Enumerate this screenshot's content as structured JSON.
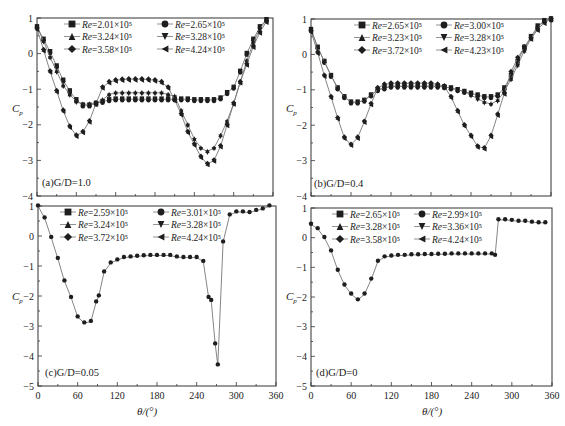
{
  "figure": {
    "y_axis_label": "C_p",
    "x_axis_label": "θ/(°)"
  },
  "chart_data": [
    {
      "type": "scatter",
      "panel_label": "(a)G/D=1.0",
      "gap_ratio": "1.0",
      "xlabel": "",
      "ylabel": "Cp",
      "xlim": [
        0,
        360
      ],
      "ylim": [
        -4,
        1
      ],
      "xticks": [
        0,
        60,
        120,
        180,
        240,
        300,
        360
      ],
      "yticks": [
        1,
        0,
        -1,
        -2,
        -3,
        -4
      ],
      "ytick_labels": [
        "1",
        "0",
        "−1",
        "−2",
        "−3",
        "−4"
      ],
      "show_xtick_labels": false,
      "legend_position": "top-center",
      "legend": [
        "Re=2.01×10⁵",
        "Re=2.65×10⁵",
        "Re=3.24×10⁵",
        "Re=3.28×10⁵",
        "Re=3.58×10⁵",
        "Re=4.24×10⁵"
      ],
      "markers": [
        "square",
        "circle",
        "triangle-up",
        "triangle-down",
        "diamond",
        "triangle-left"
      ],
      "series": [
        {
          "name": "low Re group (Re=2.01–2.65×10⁵)",
          "x": [
            0,
            10,
            20,
            30,
            40,
            50,
            60,
            70,
            80,
            90,
            100,
            110,
            120,
            130,
            140,
            150,
            160,
            170,
            180,
            190,
            200,
            210,
            220,
            230,
            240,
            250,
            260,
            270,
            280,
            290,
            300,
            310,
            320,
            330,
            340,
            350
          ],
          "values": [
            0.75,
            0.4,
            0.05,
            -0.35,
            -0.75,
            -1.05,
            -1.3,
            -1.45,
            -1.45,
            -1.4,
            -1.35,
            -1.3,
            -1.28,
            -1.28,
            -1.28,
            -1.28,
            -1.28,
            -1.28,
            -1.28,
            -1.28,
            -1.28,
            -1.28,
            -1.28,
            -1.28,
            -1.3,
            -1.3,
            -1.3,
            -1.3,
            -1.25,
            -1.1,
            -0.95,
            -0.5,
            0.0,
            0.4,
            0.75,
            0.95
          ]
        },
        {
          "name": "mid Re group (Re=3.24–3.28×10⁵)",
          "x": [
            0,
            10,
            20,
            30,
            40,
            50,
            60,
            70,
            80,
            90,
            100,
            110,
            120,
            130,
            140,
            150,
            160,
            170,
            180,
            190,
            200,
            210,
            220,
            230,
            240,
            250,
            260,
            270,
            280,
            290,
            300,
            310,
            320,
            330,
            340,
            350
          ],
          "values": [
            0.75,
            0.35,
            -0.1,
            -0.5,
            -0.9,
            -1.15,
            -1.35,
            -1.42,
            -1.42,
            -1.38,
            -1.3,
            -1.15,
            -1.1,
            -1.1,
            -1.1,
            -1.1,
            -1.1,
            -1.1,
            -1.1,
            -1.1,
            -1.15,
            -1.2,
            -1.6,
            -2.0,
            -2.4,
            -2.65,
            -2.75,
            -2.65,
            -2.3,
            -1.9,
            -1.4,
            -0.8,
            -0.2,
            0.3,
            0.7,
            0.95
          ]
        },
        {
          "name": "high Re group (Re=3.58–4.24×10⁵)",
          "x": [
            0,
            10,
            20,
            30,
            40,
            50,
            60,
            70,
            80,
            90,
            100,
            110,
            120,
            130,
            140,
            150,
            160,
            170,
            180,
            190,
            200,
            210,
            220,
            230,
            240,
            250,
            260,
            270,
            280,
            290,
            300,
            310,
            320,
            330,
            340,
            350
          ],
          "values": [
            0.7,
            0.1,
            -0.5,
            -1.05,
            -1.6,
            -2.05,
            -2.3,
            -2.2,
            -1.9,
            -1.4,
            -0.95,
            -0.8,
            -0.75,
            -0.73,
            -0.72,
            -0.72,
            -0.72,
            -0.73,
            -0.75,
            -0.8,
            -0.95,
            -1.3,
            -1.7,
            -2.2,
            -2.55,
            -2.9,
            -3.1,
            -3.0,
            -2.6,
            -2.0,
            -1.4,
            -0.8,
            -0.3,
            0.2,
            0.6,
            0.9
          ]
        }
      ]
    },
    {
      "type": "scatter",
      "panel_label": "(b)G/D=0.4",
      "gap_ratio": "0.4",
      "xlabel": "",
      "ylabel": "Cp",
      "xlim": [
        0,
        360
      ],
      "ylim": [
        -4,
        1
      ],
      "xticks": [
        0,
        60,
        120,
        180,
        240,
        300,
        360
      ],
      "yticks": [
        1,
        0,
        -1,
        -2,
        -3,
        -4
      ],
      "ytick_labels": [
        "1",
        "0",
        "−1",
        "−2",
        "−3",
        "−4"
      ],
      "show_xtick_labels": false,
      "legend_position": "top-center",
      "legend": [
        "Re=2.65×10⁵",
        "Re=3.00×10⁵",
        "Re=3.23×10⁵",
        "Re=3.28×10⁵",
        "Re=3.72×10⁵",
        "Re=4.23×10⁵"
      ],
      "markers": [
        "square",
        "circle",
        "triangle-up",
        "triangle-down",
        "diamond",
        "triangle-left"
      ],
      "series": [
        {
          "name": "low Re group (Re=2.65–3.00×10⁵)",
          "x": [
            0,
            10,
            20,
            30,
            40,
            50,
            60,
            70,
            80,
            90,
            100,
            110,
            120,
            130,
            140,
            150,
            160,
            170,
            180,
            190,
            200,
            210,
            220,
            230,
            240,
            250,
            260,
            270,
            280,
            290,
            300,
            310,
            320,
            330,
            340,
            350,
            360
          ],
          "values": [
            0.7,
            0.2,
            -0.2,
            -0.6,
            -0.95,
            -1.2,
            -1.35,
            -1.35,
            -1.3,
            -1.15,
            -1.0,
            -0.95,
            -0.9,
            -0.9,
            -0.9,
            -0.9,
            -0.9,
            -0.9,
            -0.9,
            -0.9,
            -0.92,
            -0.95,
            -1.0,
            -1.05,
            -1.1,
            -1.15,
            -1.2,
            -1.2,
            -1.15,
            -0.95,
            -0.6,
            -0.2,
            0.2,
            0.5,
            0.8,
            0.95,
            1.0
          ]
        },
        {
          "name": "mid Re group (Re=3.23–3.28×10⁵)",
          "x": [
            0,
            10,
            20,
            30,
            40,
            50,
            60,
            70,
            80,
            90,
            100,
            110,
            120,
            130,
            140,
            150,
            160,
            170,
            180,
            190,
            200,
            210,
            220,
            230,
            240,
            250,
            260,
            270,
            280,
            290,
            300,
            310,
            320,
            330,
            340,
            350,
            360
          ],
          "values": [
            0.7,
            0.2,
            -0.2,
            -0.6,
            -0.95,
            -1.2,
            -1.35,
            -1.35,
            -1.3,
            -1.15,
            -1.0,
            -0.95,
            -0.9,
            -0.9,
            -0.9,
            -0.9,
            -0.9,
            -0.9,
            -0.9,
            -0.9,
            -0.92,
            -0.95,
            -1.0,
            -1.05,
            -1.15,
            -1.25,
            -1.35,
            -1.4,
            -1.3,
            -1.05,
            -0.7,
            -0.3,
            0.1,
            0.45,
            0.75,
            0.95,
            1.0
          ]
        },
        {
          "name": "high Re group (Re=3.72–4.23×10⁵)",
          "x": [
            0,
            10,
            20,
            30,
            40,
            50,
            60,
            70,
            80,
            90,
            100,
            110,
            120,
            130,
            140,
            150,
            160,
            170,
            180,
            190,
            200,
            210,
            220,
            230,
            240,
            250,
            260,
            270,
            280,
            290,
            300,
            310,
            320,
            330,
            340,
            350,
            360
          ],
          "values": [
            0.65,
            0.05,
            -0.6,
            -1.2,
            -1.8,
            -2.35,
            -2.55,
            -2.35,
            -1.9,
            -1.4,
            -0.95,
            -0.85,
            -0.82,
            -0.82,
            -0.82,
            -0.82,
            -0.82,
            -0.82,
            -0.82,
            -0.85,
            -0.9,
            -1.2,
            -1.6,
            -2.0,
            -2.3,
            -2.6,
            -2.65,
            -2.3,
            -1.7,
            -1.1,
            -0.5,
            -0.1,
            0.2,
            0.45,
            0.7,
            0.9,
            1.0
          ]
        }
      ]
    },
    {
      "type": "scatter",
      "panel_label": "(c)G/D=0.05",
      "gap_ratio": "0.05",
      "xlabel": "θ/(°)",
      "ylabel": "Cp",
      "xlim": [
        0,
        360
      ],
      "ylim": [
        -5,
        1
      ],
      "xticks": [
        0,
        60,
        120,
        180,
        240,
        300,
        360
      ],
      "yticks": [
        1,
        0,
        -1,
        -2,
        -3,
        -4,
        -5
      ],
      "ytick_labels": [
        "1",
        "0",
        "−1",
        "−2",
        "−3",
        "−4",
        "−5"
      ],
      "show_xtick_labels": true,
      "legend_position": "top-center",
      "legend": [
        "Re=2.59×10⁵",
        "Re=3.01×10⁵",
        "Re=3.24×10⁵",
        "Re=3.28×10⁵",
        "Re=3.72×10⁵",
        "Re=4.24×10⁵"
      ],
      "markers": [
        "square",
        "circle",
        "triangle-up",
        "triangle-down",
        "diamond",
        "triangle-left"
      ],
      "series": [
        {
          "name": "all Re (collapsed)",
          "x": [
            0,
            10,
            20,
            30,
            40,
            50,
            60,
            70,
            80,
            88,
            92,
            100,
            110,
            120,
            130,
            140,
            150,
            160,
            170,
            180,
            190,
            200,
            210,
            220,
            230,
            240,
            250,
            258,
            262,
            268,
            272,
            280,
            290,
            300,
            310,
            320,
            330,
            340,
            350
          ],
          "values": [
            1.0,
            0.6,
            -0.05,
            -0.75,
            -1.5,
            -2.05,
            -2.7,
            -2.9,
            -2.85,
            -2.2,
            -2.0,
            -1.2,
            -0.9,
            -0.8,
            -0.72,
            -0.7,
            -0.68,
            -0.66,
            -0.65,
            -0.65,
            -0.65,
            -0.65,
            -0.7,
            -0.72,
            -0.72,
            -0.72,
            -0.85,
            -2.05,
            -2.15,
            -3.6,
            -4.3,
            -0.2,
            0.7,
            0.8,
            0.8,
            0.78,
            0.85,
            0.9,
            1.0
          ]
        }
      ]
    },
    {
      "type": "scatter",
      "panel_label": "(d)G/D=0",
      "gap_ratio": "0",
      "xlabel": "θ/(°)",
      "ylabel": "Cp",
      "xlim": [
        0,
        360
      ],
      "ylim": [
        -5,
        1
      ],
      "xticks": [
        0,
        60,
        120,
        180,
        240,
        300,
        360
      ],
      "yticks": [
        1,
        0,
        -1,
        -2,
        -3,
        -4,
        -5
      ],
      "ytick_labels": [
        "1",
        "0",
        "−1",
        "−2",
        "−3",
        "−4",
        "−5"
      ],
      "show_xtick_labels": true,
      "legend_position": "top-center",
      "legend": [
        "Re=2.65×10⁵",
        "Re=2.99×10⁵",
        "Re=3.28×10⁵",
        "Re=3.36×10⁵",
        "Re=3.58×10⁵",
        "Re=4.24×10⁵"
      ],
      "markers": [
        "square",
        "circle",
        "triangle-up",
        "triangle-down",
        "diamond",
        "triangle-left"
      ],
      "series": [
        {
          "name": "all Re (collapsed)",
          "x": [
            0,
            10,
            20,
            30,
            40,
            50,
            60,
            70,
            80,
            90,
            100,
            110,
            120,
            130,
            140,
            150,
            160,
            170,
            180,
            190,
            200,
            210,
            220,
            230,
            240,
            250,
            260,
            270,
            275,
            280,
            290,
            300,
            310,
            320,
            330,
            340,
            350
          ],
          "values": [
            0.45,
            0.3,
            0.0,
            -0.45,
            -1.1,
            -1.6,
            -1.9,
            -2.1,
            -1.9,
            -1.4,
            -0.8,
            -0.65,
            -0.62,
            -0.6,
            -0.6,
            -0.58,
            -0.58,
            -0.57,
            -0.57,
            -0.56,
            -0.56,
            -0.55,
            -0.55,
            -0.55,
            -0.55,
            -0.55,
            -0.55,
            -0.55,
            -0.6,
            0.6,
            0.6,
            0.58,
            0.55,
            0.55,
            0.52,
            0.5,
            0.5
          ]
        }
      ]
    }
  ]
}
